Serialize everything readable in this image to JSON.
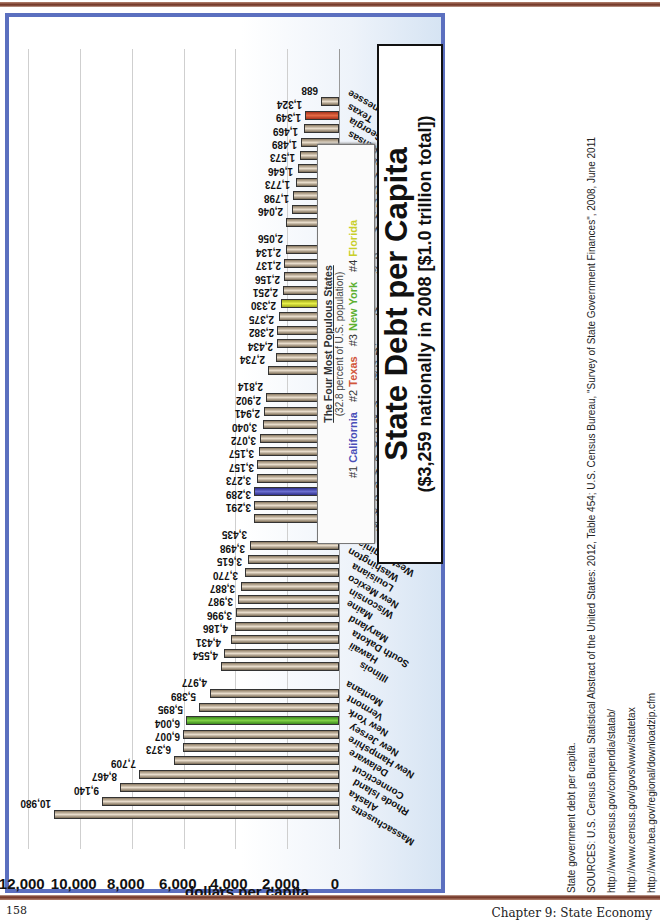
{
  "page": {
    "page_number": "158",
    "chapter": "Chapter 9: State Economy"
  },
  "title": {
    "main": "State Debt per Capita",
    "sub": "($3,259 nationally in 2008 [$1.0 trillion total])"
  },
  "legend": {
    "title": "The Four Most Populous States",
    "note": "(32.8 percent of U.S. population)",
    "items": [
      {
        "rank": "#1",
        "name": "California",
        "color": "#4a4fb8"
      },
      {
        "rank": "#2",
        "name": "Texas",
        "color": "#d2553a"
      },
      {
        "rank": "#3",
        "name": "New York",
        "color": "#5cb030"
      },
      {
        "rank": "#4",
        "name": "Florida",
        "color": "#c8cf2a"
      }
    ]
  },
  "chart_data": {
    "type": "bar",
    "orientation": "horizontal (page rotated 90°)",
    "title": "State Debt per Capita",
    "subtitle": "($3,259 nationally in 2008 [$1.0 trillion total])",
    "xlabel": "",
    "ylabel": "dollars per capita",
    "ylim": [
      0,
      12000
    ],
    "ticks": [
      "0",
      "2,000",
      "4,000",
      "6,000",
      "8,000",
      "10,000",
      "12,000"
    ],
    "grid": true,
    "legend_position": "top (boxed, under title)",
    "categories": [
      "Massachusetts",
      "Alaska",
      "Rhode Island",
      "Connecticut",
      "Delaware",
      "New Hampshire",
      "New Jersey",
      "New York",
      "Vermont",
      "Montana",
      "Illinois",
      "Hawaii",
      "South Dakota",
      "Maryland",
      "Maine",
      "Wisconsin",
      "New Mexico",
      "Louisiana",
      "Washington",
      "West Virginia",
      "Missouri",
      "South Carolina",
      "California",
      "Colorado",
      "Pennsylvania",
      "Indiana",
      "Oregon",
      "Michigan",
      "North Dakota",
      "Kentucky",
      "Virginia",
      "Oklahoma",
      "Wyoming",
      "Iowa",
      "Ohio",
      "Florida",
      "Idaho",
      "Utah",
      "Mississippi",
      "North Carolina",
      "Kansas",
      "Minnesota",
      "Alabama",
      "Arizona",
      "Nevada",
      "Nebraska",
      "Arkansas",
      "Georgia",
      "Texas",
      "Tennessee"
    ],
    "values": [
      10980,
      9140,
      8467,
      7709,
      6373,
      6007,
      6004,
      5895,
      5389,
      4977,
      4554,
      4431,
      4186,
      3996,
      3987,
      3887,
      3770,
      3615,
      3498,
      3435,
      3291,
      3289,
      3273,
      3157,
      3157,
      3072,
      3040,
      2941,
      2902,
      2814,
      2734,
      2434,
      2382,
      2375,
      2330,
      2251,
      2156,
      2137,
      2134,
      2056,
      2046,
      1798,
      1773,
      1646,
      1573,
      1489,
      1469,
      1349,
      1324,
      688
    ],
    "value_labels": [
      "10,980",
      "9,140",
      "8,467",
      "7,709",
      "6,373",
      "6,007",
      "6,004",
      "5,895",
      "5,389",
      "4,977",
      "4,554",
      "4,431",
      "4,186",
      "3,996",
      "3,987",
      "3,887",
      "3,770",
      "3,615",
      "3,498",
      "3,435",
      "3,291",
      "3,289",
      "3,273",
      "3,157",
      "3,157",
      "3,072",
      "3,040",
      "2,941",
      "2,902",
      "2,814",
      "2,734",
      "2,434",
      "2,382",
      "2,375",
      "2,330",
      "2,251",
      "2,156",
      "2,137",
      "2,134",
      "2,056",
      "2,046",
      "1,798",
      "1,773",
      "1,646",
      "1,573",
      "1,489",
      "1,469",
      "1,349",
      "1,324",
      "688"
    ],
    "group_sizes": [
      10,
      10,
      10,
      10,
      10
    ],
    "highlights": {
      "California": "#4a4fb8",
      "Texas": "#d2553a",
      "New York": "#5cb030",
      "Florida": "#c8cf2a"
    },
    "bar_color": "#cfc2ad"
  },
  "sources": {
    "caption": "State government debt per capita.",
    "citation": "SOURCES: U.S. Census Bureau Statistical Abstract of the United States: 2012, Table 454; U.S. Census Bureau, \"Survey of State Government Finances\", 2008, June 2011",
    "links": [
      "http://www.census.gov/compendia/statab/",
      "http://www.census.gov/govs/www/statetax",
      "http://www.bea.gov/regional/downloadzip.cfm"
    ]
  }
}
